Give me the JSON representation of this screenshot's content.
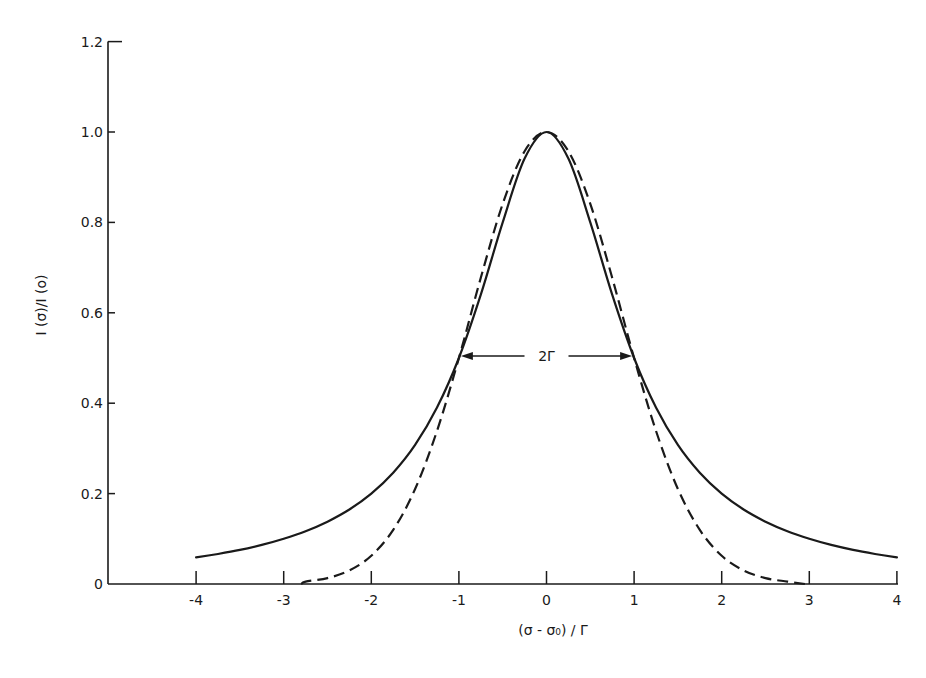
{
  "chart_data": {
    "type": "line",
    "title": "",
    "xlabel": "(σ - σ₀) / Γ",
    "ylabel": "I (σ)/I (o)",
    "xlim": [
      -4.9,
      4
    ],
    "ylim": [
      0,
      1.2
    ],
    "grid": false,
    "legend": null,
    "x_ticks": [
      -4,
      -3,
      -2,
      -1,
      0,
      1,
      2,
      3,
      4
    ],
    "x_tick_labels": [
      "-4",
      "-3",
      "-2",
      "-1",
      "0",
      "1",
      "2",
      "3",
      "4"
    ],
    "y_ticks": [
      0,
      0.2,
      0.4,
      0.6,
      0.8,
      1.0,
      1.2
    ],
    "y_tick_labels": [
      "0",
      "0.2",
      "0.4",
      "0.6",
      "0.8",
      "1.0",
      "1.2"
    ],
    "annotations": [
      {
        "text": "2Γ",
        "type": "double-arrow",
        "x_from": -1,
        "x_to": 1,
        "y": 0.5
      }
    ],
    "series": [
      {
        "name": "Lorentzian (solid)",
        "style": "solid",
        "x": [
          -4,
          -3.75,
          -3.5,
          -3.25,
          -3,
          -2.75,
          -2.5,
          -2.25,
          -2,
          -1.75,
          -1.5,
          -1.25,
          -1,
          -0.75,
          -0.5,
          -0.25,
          0,
          0.25,
          0.5,
          0.75,
          1,
          1.25,
          1.5,
          1.75,
          2,
          2.25,
          2.5,
          2.75,
          3,
          3.25,
          3.5,
          3.75,
          4
        ],
        "values": [
          0.0588,
          0.0664,
          0.0755,
          0.0865,
          0.1,
          0.1168,
          0.1379,
          0.1649,
          0.2,
          0.2462,
          0.3077,
          0.3902,
          0.5,
          0.64,
          0.8,
          0.9412,
          1.0,
          0.9412,
          0.8,
          0.64,
          0.5,
          0.3902,
          0.3077,
          0.2462,
          0.2,
          0.1649,
          0.1379,
          0.1168,
          0.1,
          0.0865,
          0.0755,
          0.0664,
          0.0588
        ]
      },
      {
        "name": "Gaussian (dashed)",
        "style": "dashed",
        "x": [
          -2.8,
          -2.75,
          -2.5,
          -2.25,
          -2,
          -1.75,
          -1.5,
          -1.25,
          -1,
          -0.75,
          -0.5,
          -0.25,
          0,
          0.25,
          0.5,
          0.75,
          1,
          1.25,
          1.5,
          1.75,
          2,
          2.25,
          2.5,
          2.75,
          2.95
        ],
        "values": [
          0.0,
          0.0053,
          0.0131,
          0.03,
          0.0625,
          0.1197,
          0.2102,
          0.3387,
          0.5,
          0.6774,
          0.8409,
          0.9576,
          1.0,
          0.9576,
          0.8409,
          0.6774,
          0.5,
          0.3387,
          0.2102,
          0.1197,
          0.0625,
          0.03,
          0.0131,
          0.0053,
          0.0
        ]
      }
    ]
  },
  "layout": {
    "plot_left_px": 108,
    "x_zero_px": 546.5,
    "x_unit_px": 87.6,
    "y_zero_px": 584,
    "y_unit_px": 452,
    "x_axis_end_px": 898,
    "ink_color": "#1a1a1a"
  }
}
